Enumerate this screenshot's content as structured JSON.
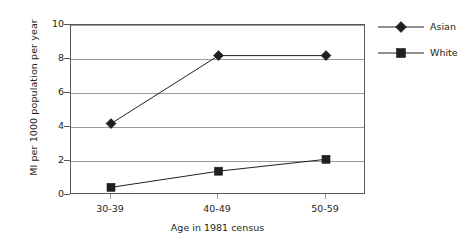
{
  "chart_data": {
    "type": "line",
    "title": "",
    "xlabel": "Age in 1981 census",
    "ylabel": "MI per 1000 population per year",
    "categories": [
      "30-39",
      "40-49",
      "50-59"
    ],
    "ylim": [
      0,
      10
    ],
    "yticks": [
      0,
      2,
      4,
      6,
      8,
      10
    ],
    "grid": true,
    "legend_position": "right",
    "series": [
      {
        "name": "Asian",
        "marker": "diamond",
        "color": "#231f20",
        "values": [
          4.2,
          8.2,
          8.2
        ]
      },
      {
        "name": "White",
        "marker": "square",
        "color": "#231f20",
        "values": [
          0.45,
          1.4,
          2.1
        ]
      }
    ]
  },
  "axes": {
    "y_title": "MI per 1000 population per year",
    "x_title": "Age in 1981 census",
    "y_tick_labels": [
      "10",
      "8",
      "6",
      "4",
      "2",
      "0"
    ],
    "x_tick_labels": [
      "30-39",
      "40-49",
      "50-59"
    ]
  },
  "legend": {
    "items": [
      {
        "label": "Asian",
        "marker": "diamond-marker-icon"
      },
      {
        "label": "White",
        "marker": "square-marker-icon"
      }
    ]
  }
}
